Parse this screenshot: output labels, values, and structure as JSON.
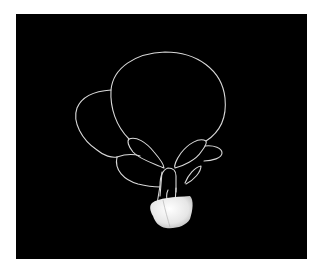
{
  "image": {
    "description": "Line drawing of a hot-air balloon with lobes and petal shapes on a black background, white textured basket at bottom",
    "background_color": "#000000",
    "line_color": "#d8d8d8",
    "basket_color": "#f0f0f0"
  }
}
